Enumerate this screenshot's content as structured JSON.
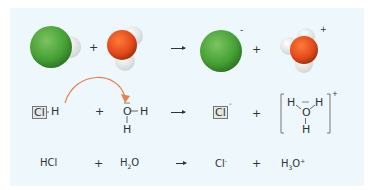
{
  "colors": {
    "chlorine": "#4aa53a",
    "oxygen": "#e8501c",
    "hydrogen": "#ffffff",
    "background": "#eef7fb",
    "curved_arrow": "#e8834a"
  },
  "row1": {
    "plus1": "+",
    "plus2": "+",
    "cl_charge": "-",
    "h3o_charge": "+"
  },
  "row2": {
    "hcl_cl": "Cl",
    "hcl_h": "H",
    "plus1": "+",
    "water_o": "O",
    "water_h_right": "H",
    "water_h_bottom": "H",
    "cl_ion": "Cl",
    "cl_ion_charge": "-",
    "plus2": "+",
    "h3o_h_left": "H",
    "h3o_h_right": "H",
    "h3o_o": "O",
    "h3o_h_bottom": "H",
    "h3o_charge": "+"
  },
  "row3": {
    "hcl": "HCl",
    "plus1": "+",
    "h2o_h": "H",
    "h2o_sub": "2",
    "h2o_o": "O",
    "cl": "Cl",
    "cl_charge": "-",
    "plus2": "+",
    "h3o_h": "H",
    "h3o_sub": "3",
    "h3o_o": "O",
    "h3o_charge": "+"
  }
}
